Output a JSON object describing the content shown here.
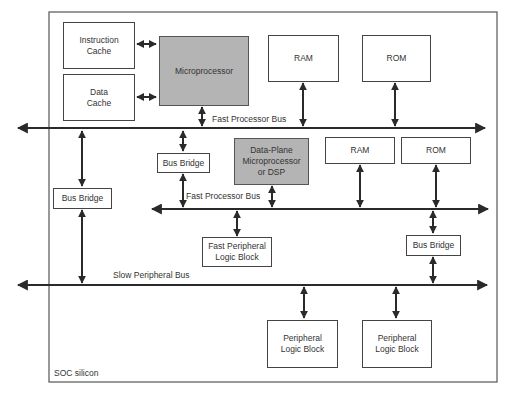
{
  "diagram": {
    "container": {
      "label": "SOC silicon"
    },
    "blocks": {
      "instruction_cache": "Instruction\nCache",
      "data_cache": "Data\nCache",
      "microprocessor": "Microprocessor",
      "ram_top": "RAM",
      "rom_top": "ROM",
      "bus_bridge_left": "Bus Bridge",
      "bus_bridge_mid": "Bus Bridge",
      "dsp": "Data-Plane\nMicroprocessor\nor DSP",
      "ram_mid": "RAM",
      "rom_mid": "ROM",
      "fast_peripheral": "Fast Peripheral\nLogic Block",
      "bus_bridge_right": "Bus Bridge",
      "peripheral_1": "Peripheral\nLogic Block",
      "peripheral_2": "Peripheral\nLogic Block"
    },
    "buses": {
      "fast_bus_1": "Fast Processor Bus",
      "fast_bus_2": "Fast Processor Bus",
      "slow_bus": "Slow Peripheral Bus"
    },
    "colors": {
      "line": "#2a2a2a",
      "box_border": "#444444",
      "processor_fill": "#b4b4b4"
    }
  }
}
